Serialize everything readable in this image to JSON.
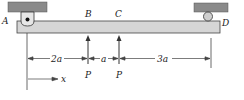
{
  "diagram": {
    "type": "simply supported beam",
    "points": {
      "A": "A",
      "B": "B",
      "C": "C",
      "D": "D"
    },
    "loads": [
      {
        "label": "P",
        "at": "B",
        "direction": "up"
      },
      {
        "label": "P",
        "at": "C",
        "direction": "up"
      }
    ],
    "dimensions": {
      "AB": "2a",
      "BC": "a",
      "CD": "3a"
    },
    "axis": {
      "label": "x"
    },
    "colors": {
      "support": "#8a8a8a",
      "beam": "#d6d6d6",
      "line": "#222222"
    }
  }
}
